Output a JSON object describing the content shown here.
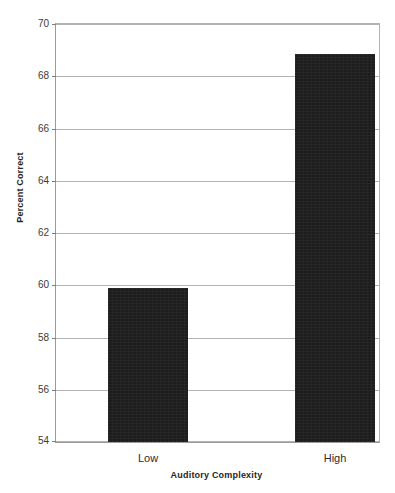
{
  "chart_data": {
    "type": "bar",
    "title": "",
    "categories": [
      "Low",
      "High"
    ],
    "values": [
      59.9,
      68.85
    ],
    "xlabel": "Auditory Complexity",
    "ylabel": "Percent Correct",
    "ylim": [
      54,
      70
    ],
    "ytick_labels": [
      "70",
      "68",
      "66",
      "64",
      "62",
      "60",
      "58",
      "56",
      "54"
    ],
    "ytick_values": [
      70,
      68,
      66,
      64,
      62,
      60,
      58,
      56,
      54
    ],
    "ytick_step": 2,
    "grid": "horizontal",
    "legend": "none",
    "series": [
      {
        "name": "Percent Correct",
        "values": [
          59.9,
          68.85
        ]
      }
    ],
    "colors": {
      "bar": "#1d1d1d",
      "gridline": "#b3b3b3",
      "axis": "#9a9a9a",
      "background": "#ffffff",
      "text": "#2b2b2b"
    }
  }
}
